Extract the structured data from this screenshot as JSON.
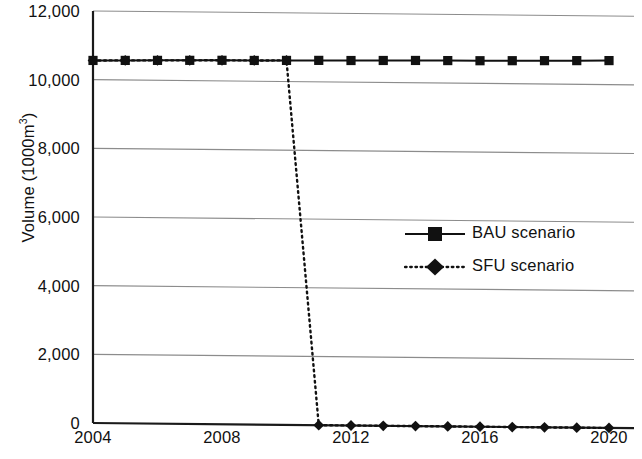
{
  "chart_data": {
    "type": "line",
    "title": "",
    "subtitle": "",
    "xlabel": "",
    "ylabel": "Volume (1000m",
    "ylabel_sup": "3",
    "ylabel_suffix": ")",
    "ylabel_full": "Volume (1000m³)",
    "x": [
      2004,
      2005,
      2006,
      2007,
      2008,
      2009,
      2010,
      2011,
      2012,
      2013,
      2014,
      2015,
      2016,
      2017,
      2018,
      2019,
      2020
    ],
    "xlim": [
      2004,
      2020
    ],
    "ylim": [
      0,
      12000
    ],
    "xticks": [
      2004,
      2008,
      2012,
      2016,
      2020
    ],
    "xtick_labels": [
      "2004",
      "2008",
      "2012",
      "2016",
      "2020"
    ],
    "yticks": [
      0,
      2000,
      4000,
      6000,
      8000,
      10000,
      12000
    ],
    "ytick_labels": [
      "0",
      "2,000",
      "4,000",
      "6,000",
      "8,000",
      "10,000",
      "12,000"
    ],
    "grid": true,
    "grid_axis": "y",
    "grid_color": "#8c8c8c",
    "legend_position": "center-right",
    "series": [
      {
        "name": "BAU scenario",
        "label": "BAU scenario",
        "marker": "square",
        "linestyle": "solid",
        "color": "#111111",
        "values": [
          10560,
          10570,
          10580,
          10590,
          10600,
          10605,
          10615,
          10625,
          10630,
          10640,
          10650,
          10655,
          10660,
          10670,
          10680,
          10690,
          10700
        ]
      },
      {
        "name": "SFU scenario",
        "label": "SFU scenario",
        "marker": "diamond",
        "linestyle": "dotted",
        "color": "#111111",
        "values": [
          10560,
          10570,
          10580,
          10590,
          10600,
          10605,
          10615,
          0,
          0,
          0,
          0,
          0,
          0,
          0,
          0,
          0,
          0
        ]
      }
    ]
  },
  "legend": {
    "items": [
      {
        "label": "BAU scenario",
        "marker": "square",
        "linestyle": "solid"
      },
      {
        "label": "SFU scenario",
        "marker": "diamond",
        "linestyle": "dotted"
      }
    ]
  }
}
